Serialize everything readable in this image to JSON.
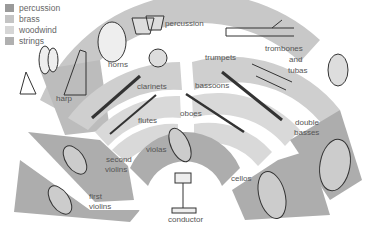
{
  "legend": {
    "items": [
      {
        "label": "percussion",
        "color": "#9a9a9a"
      },
      {
        "label": "brass",
        "color": "#c4c4c4"
      },
      {
        "label": "woodwind",
        "color": "#d6d6d6"
      },
      {
        "label": "strings",
        "color": "#b0b0b0"
      }
    ]
  },
  "sections": {
    "percussion": "percussion",
    "harp": "harp",
    "horns": "horns",
    "trumpets": "trumpets",
    "trombones_1": "trombones",
    "trombones_2": "and",
    "trombones_3": "tubas",
    "clarinets": "clarinets",
    "bassoons": "bassoons",
    "flutes": "flutes",
    "oboes": "oboes",
    "violas": "violas",
    "second_violins_1": "second",
    "second_violins_2": "violins",
    "first_violins_1": "first",
    "first_violins_2": "violins",
    "cellos": "cellos",
    "double_basses_1": "double",
    "double_basses_2": "basses",
    "conductor": "conductor"
  },
  "colors": {
    "percussion_band": "#c8c8c8",
    "brass_band": "#cfcfcf",
    "woodwind_band": "#d9d9d9",
    "strings_band": "#a9a9a9",
    "instrument_line": "#333333"
  }
}
